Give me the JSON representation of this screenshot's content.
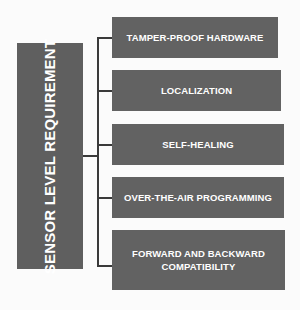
{
  "diagram": {
    "root": {
      "label": "SENSOR LEVEL REQUIREMENT"
    },
    "requirements": [
      {
        "label": "TAMPER-PROOF HARDWARE"
      },
      {
        "label": "LOCALIZATION"
      },
      {
        "label": "SELF-HEALING"
      },
      {
        "label": "OVER-THE-AIR PROGRAMMING"
      },
      {
        "label": "FORWARD AND BACKWARD COMPATIBILITY"
      }
    ],
    "colors": {
      "box_fill": "#606060",
      "text": "#ffffff",
      "connector": "#3a3a3a",
      "background": "#fbfbfb"
    }
  }
}
